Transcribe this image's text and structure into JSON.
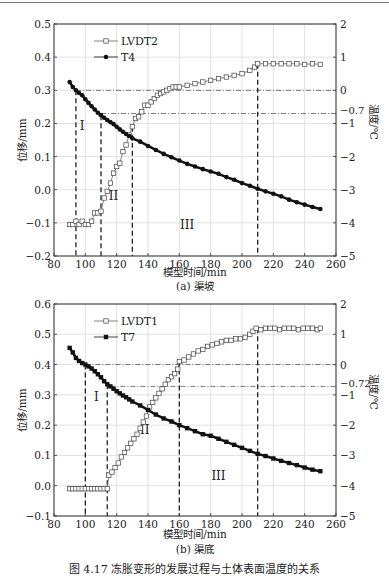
{
  "figure_caption": "图 4.17 冻胀变形的发展过程与土体表面温度的关系",
  "chart_data": [
    {
      "type": "line",
      "subtitle": "(a) 渠坡",
      "xlabel": "模型时间/min",
      "ylabel": "位移/mm",
      "y2label": "温度/℃",
      "xlim": [
        80,
        260
      ],
      "ylim": [
        -0.2,
        0.5
      ],
      "y2lim": [
        -5,
        2
      ],
      "xticks": [
        80,
        100,
        120,
        140,
        160,
        180,
        200,
        220,
        240,
        260
      ],
      "yticks": [
        "-0.2",
        "-0.1",
        "0.0",
        "0.1",
        "0.2",
        "0.3",
        "0.4",
        "0.5"
      ],
      "y2ticks": [
        "-5",
        "-4",
        "-3",
        "-2",
        "-1",
        "0",
        "1",
        "2"
      ],
      "grid": true,
      "legend": [
        "LVDT2",
        "T4"
      ],
      "legend_position": "upper left",
      "reference_lines_temp": [
        {
          "value": 0,
          "label": "0"
        },
        {
          "value": -0.7,
          "label": "-0.7"
        }
      ],
      "phase_lines_x": [
        94,
        110,
        130,
        210
      ],
      "phase_labels": [
        {
          "label": "I",
          "x": 98,
          "y": 0.18
        },
        {
          "label": "II",
          "x": 118,
          "y": -0.03
        },
        {
          "label": "III",
          "x": 165,
          "y": -0.12
        }
      ],
      "series": [
        {
          "name": "LVDT2",
          "axis": "left",
          "marker": "open-square",
          "x": [
            90,
            92,
            94,
            96,
            98,
            100,
            102,
            104,
            106,
            108,
            110,
            112,
            114,
            116,
            118,
            120,
            122,
            124,
            126,
            128,
            130,
            132,
            134,
            136,
            138,
            140,
            142,
            144,
            146,
            148,
            150,
            152,
            154,
            156,
            158,
            160,
            165,
            170,
            175,
            180,
            185,
            190,
            195,
            200,
            205,
            208,
            210,
            215,
            220,
            225,
            230,
            235,
            240,
            245,
            250
          ],
          "values": [
            -0.105,
            -0.105,
            -0.095,
            -0.105,
            -0.095,
            -0.105,
            -0.105,
            -0.095,
            -0.07,
            -0.07,
            -0.065,
            -0.025,
            -0.005,
            0.02,
            0.05,
            0.07,
            0.08,
            0.115,
            0.135,
            0.165,
            0.19,
            0.215,
            0.22,
            0.235,
            0.255,
            0.255,
            0.265,
            0.275,
            0.285,
            0.29,
            0.295,
            0.3,
            0.305,
            0.31,
            0.31,
            0.31,
            0.315,
            0.32,
            0.325,
            0.33,
            0.335,
            0.34,
            0.345,
            0.35,
            0.36,
            0.37,
            0.38,
            0.38,
            0.38,
            0.38,
            0.38,
            0.38,
            0.378,
            0.38,
            0.378
          ]
        },
        {
          "name": "T4",
          "axis": "right",
          "marker": "filled-circle",
          "x": [
            90,
            92,
            94,
            96,
            98,
            100,
            102,
            104,
            106,
            108,
            110,
            112,
            114,
            116,
            118,
            120,
            122,
            124,
            126,
            128,
            130,
            135,
            140,
            145,
            150,
            155,
            160,
            165,
            170,
            175,
            180,
            185,
            190,
            195,
            200,
            205,
            210,
            215,
            220,
            225,
            230,
            235,
            240,
            245,
            250
          ],
          "values": [
            0.25,
            0.1,
            0.0,
            -0.08,
            -0.15,
            -0.27,
            -0.38,
            -0.48,
            -0.58,
            -0.68,
            -0.75,
            -0.83,
            -0.9,
            -0.96,
            -1.02,
            -1.1,
            -1.18,
            -1.25,
            -1.32,
            -1.38,
            -1.45,
            -1.55,
            -1.68,
            -1.8,
            -1.92,
            -2.02,
            -2.12,
            -2.22,
            -2.3,
            -2.38,
            -2.45,
            -2.52,
            -2.62,
            -2.7,
            -2.8,
            -2.88,
            -2.97,
            -3.05,
            -3.12,
            -3.2,
            -3.3,
            -3.38,
            -3.45,
            -3.52,
            -3.58
          ]
        }
      ]
    },
    {
      "type": "line",
      "subtitle": "(b) 渠底",
      "xlabel": "模型时间/min",
      "ylabel": "位移/mm",
      "y2label": "温度/℃",
      "xlim": [
        80,
        260
      ],
      "ylim": [
        -0.1,
        0.6
      ],
      "y2lim": [
        -5,
        2
      ],
      "xticks": [
        80,
        100,
        120,
        140,
        160,
        180,
        200,
        220,
        240,
        260
      ],
      "yticks": [
        "-0.1",
        "0.0",
        "0.1",
        "0.2",
        "0.3",
        "0.4",
        "0.5",
        "0.6"
      ],
      "y2ticks": [
        "-5",
        "-4",
        "-3",
        "-2",
        "-1",
        "0",
        "1",
        "2"
      ],
      "grid": true,
      "legend": [
        "LVDT1",
        "T7"
      ],
      "legend_position": "upper left",
      "reference_lines_temp": [
        {
          "value": 0,
          "label": "0"
        },
        {
          "value": -0.72,
          "label": "-0.72"
        }
      ],
      "phase_lines_x": [
        100,
        114,
        160,
        210
      ],
      "phase_labels": [
        {
          "label": "I",
          "x": 107,
          "y": 0.28
        },
        {
          "label": "II",
          "x": 138,
          "y": 0.17
        },
        {
          "label": "III",
          "x": 185,
          "y": 0.02
        }
      ],
      "series": [
        {
          "name": "LVDT1",
          "axis": "left",
          "marker": "open-square",
          "x": [
            90,
            92,
            94,
            96,
            98,
            100,
            102,
            104,
            106,
            108,
            110,
            112,
            114,
            115,
            117,
            119,
            121,
            123,
            125,
            127,
            129,
            131,
            133,
            135,
            137,
            139,
            141,
            143,
            145,
            147,
            149,
            151,
            153,
            155,
            157,
            159,
            160,
            163,
            166,
            169,
            172,
            175,
            178,
            181,
            184,
            187,
            190,
            193,
            196,
            199,
            202,
            205,
            207,
            209,
            212,
            215,
            218,
            221,
            224,
            227,
            230,
            233,
            236,
            239,
            242,
            245,
            248,
            250
          ],
          "values": [
            -0.01,
            -0.01,
            -0.01,
            -0.01,
            -0.01,
            -0.01,
            -0.01,
            -0.01,
            -0.01,
            -0.01,
            -0.01,
            -0.01,
            -0.01,
            0.035,
            0.045,
            0.06,
            0.075,
            0.095,
            0.11,
            0.125,
            0.14,
            0.155,
            0.17,
            0.19,
            0.21,
            0.23,
            0.26,
            0.275,
            0.29,
            0.305,
            0.32,
            0.335,
            0.35,
            0.36,
            0.37,
            0.385,
            0.41,
            0.415,
            0.425,
            0.435,
            0.445,
            0.45,
            0.46,
            0.465,
            0.47,
            0.475,
            0.48,
            0.48,
            0.485,
            0.485,
            0.49,
            0.5,
            0.51,
            0.52,
            0.515,
            0.52,
            0.52,
            0.52,
            0.515,
            0.52,
            0.52,
            0.52,
            0.515,
            0.52,
            0.52,
            0.52,
            0.515,
            0.52
          ]
        },
        {
          "name": "T7",
          "axis": "right",
          "marker": "filled-square",
          "x": [
            90,
            92,
            94,
            96,
            98,
            100,
            102,
            104,
            106,
            108,
            110,
            112,
            114,
            116,
            118,
            120,
            122,
            124,
            126,
            128,
            130,
            135,
            140,
            145,
            150,
            155,
            160,
            165,
            170,
            175,
            180,
            185,
            190,
            195,
            200,
            205,
            210,
            215,
            220,
            225,
            230,
            235,
            240,
            245,
            250
          ],
          "values": [
            0.55,
            0.4,
            0.22,
            0.12,
            0.05,
            0.0,
            -0.06,
            -0.13,
            -0.22,
            -0.32,
            -0.42,
            -0.55,
            -0.65,
            -0.72,
            -0.8,
            -0.88,
            -0.95,
            -1.02,
            -1.08,
            -1.15,
            -1.22,
            -1.35,
            -1.5,
            -1.65,
            -1.78,
            -1.88,
            -2.0,
            -2.1,
            -2.2,
            -2.3,
            -2.35,
            -2.45,
            -2.55,
            -2.65,
            -2.75,
            -2.85,
            -2.95,
            -3.02,
            -3.1,
            -3.18,
            -3.25,
            -3.32,
            -3.4,
            -3.47,
            -3.52
          ]
        }
      ]
    }
  ]
}
